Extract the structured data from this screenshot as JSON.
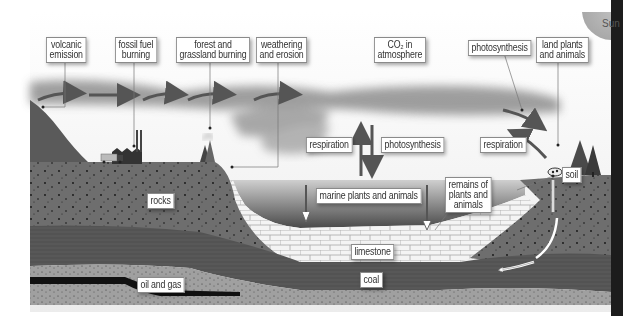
{
  "colors": {
    "sky": "#f2f2f2",
    "cloud": "#9a9a9a",
    "rock": "#6e6e6e",
    "dark_layer": "#555555",
    "sand_layer": "#9e9e9e",
    "limestone": "#f4f4f4",
    "water_top": "#c8c8c8",
    "water_bottom": "#4a4a4a",
    "oil": "#111111",
    "arrow": "#555555",
    "right_bar": "#1c1c1c"
  },
  "sun": {
    "label": "Sun"
  },
  "labels": {
    "volcanic_emission": "volcanic\nemission",
    "fossil_fuel_burning": "fossil fuel\nburning",
    "forest_grassland_burning": "forest and\ngrassland burning",
    "weathering_erosion": "weathering\nand erosion",
    "co2_atmosphere": "CO₂ in\natmosphere",
    "photosynthesis_land": "photosynthesis",
    "land_plants_animals": "land plants\nand animals",
    "respiration_ocean": "respiration",
    "photosynthesis_ocean": "photosynthesis",
    "respiration_land": "respiration",
    "soil": "soil",
    "rocks": "rocks",
    "marine_plants_animals": "marine plants and animals",
    "remains": "remains of\nplants and\nanimals",
    "limestone": "limestone",
    "oil_gas": "oil and gas",
    "coal": "coal"
  }
}
